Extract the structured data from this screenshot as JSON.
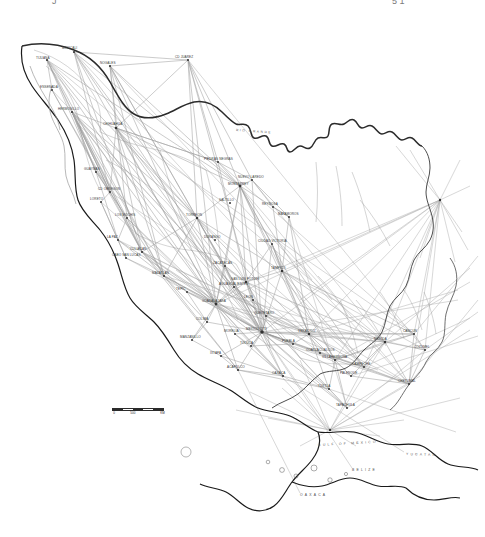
{
  "figure": {
    "kind": "map",
    "top_edge_artifacts": {
      "left_fragment": "J",
      "right_fragment": "5 1"
    }
  },
  "colors": {
    "coastline": "#1a1a1a",
    "river": "#2b2b2b",
    "internal_boundary": "#8c8c8c",
    "route_line": "#9a9a9a",
    "node": "#333333",
    "label": "#3a3a3a",
    "background": "#ffffff"
  },
  "scale_bar": {
    "label_start": "0",
    "label_mid": "500",
    "label_end": "1000",
    "units": "KM"
  },
  "hydro_labels": [
    {
      "name": "RIO GRANDE",
      "x": 236,
      "y": 128,
      "rotate": 4
    }
  ],
  "region_labels": [
    {
      "name": "GULF OF MEXICO",
      "x": 318,
      "y": 443,
      "rotate": -3
    },
    {
      "name": "YUCATAN",
      "x": 406,
      "y": 452,
      "rotate": 2
    },
    {
      "name": "BELIZE",
      "x": 352,
      "y": 468,
      "rotate": 0
    },
    {
      "name": "OAXACA",
      "x": 300,
      "y": 493,
      "rotate": 0
    }
  ],
  "places": [
    {
      "name": "TIJUANA",
      "x": 36,
      "y": 57,
      "nx": 47,
      "ny": 60
    },
    {
      "name": "MEXICALI",
      "x": 62,
      "y": 47,
      "nx": 74,
      "ny": 52
    },
    {
      "name": "NOGALES",
      "x": 100,
      "y": 62,
      "nx": 110,
      "ny": 66
    },
    {
      "name": "CD JUAREZ",
      "x": 175,
      "y": 56,
      "nx": 188,
      "ny": 60
    },
    {
      "name": "HERMOSILLO",
      "x": 58,
      "y": 108,
      "nx": 72,
      "ny": 112
    },
    {
      "name": "CHIHUAHUA",
      "x": 103,
      "y": 123,
      "nx": 116,
      "ny": 128
    },
    {
      "name": "MONTERREY",
      "x": 228,
      "y": 183,
      "nx": 240,
      "ny": 186
    },
    {
      "name": "LA PAZ",
      "x": 107,
      "y": 236,
      "nx": 118,
      "ny": 240
    },
    {
      "name": "CULIACAN",
      "x": 130,
      "y": 248,
      "nx": 142,
      "ny": 252
    },
    {
      "name": "TORREON",
      "x": 186,
      "y": 214,
      "nx": 197,
      "ny": 218
    },
    {
      "name": "DURANGO",
      "x": 204,
      "y": 236,
      "nx": 215,
      "ny": 240
    },
    {
      "name": "SALTILLO",
      "x": 219,
      "y": 199,
      "nx": 230,
      "ny": 203
    },
    {
      "name": "MAZATLAN",
      "x": 152,
      "y": 272,
      "nx": 164,
      "ny": 276
    },
    {
      "name": "TAMPICO",
      "x": 271,
      "y": 267,
      "nx": 282,
      "ny": 271
    },
    {
      "name": "SAN LUIS POTOSI",
      "x": 231,
      "y": 278,
      "nx": 246,
      "ny": 282
    },
    {
      "name": "GUADALAJARA",
      "x": 202,
      "y": 300,
      "nx": 216,
      "ny": 304
    },
    {
      "name": "LEON",
      "x": 244,
      "y": 296,
      "nx": 253,
      "ny": 300
    },
    {
      "name": "QUERETARO",
      "x": 254,
      "y": 312,
      "nx": 266,
      "ny": 316
    },
    {
      "name": "MEXICO CITY",
      "x": 246,
      "y": 328,
      "nx": 262,
      "ny": 332
    },
    {
      "name": "MANZANILLO",
      "x": 180,
      "y": 336,
      "nx": 192,
      "ny": 340
    },
    {
      "name": "PUEBLA",
      "x": 282,
      "y": 340,
      "nx": 293,
      "ny": 344
    },
    {
      "name": "VERACRUZ",
      "x": 298,
      "y": 330,
      "nx": 309,
      "ny": 334
    },
    {
      "name": "ACAPULCO",
      "x": 227,
      "y": 366,
      "nx": 238,
      "ny": 370
    },
    {
      "name": "OAXACA",
      "x": 272,
      "y": 372,
      "nx": 283,
      "ny": 376
    },
    {
      "name": "VILLAHERMOSA",
      "x": 322,
      "y": 356,
      "nx": 335,
      "ny": 360
    },
    {
      "name": "MERIDA",
      "x": 374,
      "y": 338,
      "nx": 385,
      "ny": 342
    },
    {
      "name": "CANCUN",
      "x": 403,
      "y": 330,
      "nx": 414,
      "ny": 334
    },
    {
      "name": "TUXTLA",
      "x": 318,
      "y": 385,
      "nx": 329,
      "ny": 389
    },
    {
      "name": "TAPACHULA",
      "x": 336,
      "y": 404,
      "nx": 347,
      "ny": 408
    },
    {
      "name": "CHETUMAL",
      "x": 398,
      "y": 380,
      "nx": 409,
      "ny": 384
    },
    {
      "name": "MATAMOROS",
      "x": 278,
      "y": 213,
      "nx": 289,
      "ny": 217
    },
    {
      "name": "REYNOSA",
      "x": 262,
      "y": 203,
      "nx": 273,
      "ny": 207
    },
    {
      "name": "CIUDAD VICTORIA",
      "x": 258,
      "y": 240,
      "nx": 272,
      "ny": 244
    },
    {
      "name": "ZACATECAS",
      "x": 213,
      "y": 262,
      "nx": 225,
      "ny": 266
    },
    {
      "name": "AGUASCALIENTES",
      "x": 219,
      "y": 283,
      "nx": 234,
      "ny": 287
    },
    {
      "name": "MORELIA",
      "x": 224,
      "y": 330,
      "nx": 235,
      "ny": 334
    },
    {
      "name": "TOLUCA",
      "x": 240,
      "y": 342,
      "nx": 251,
      "ny": 346
    },
    {
      "name": "COATZACOALCOS",
      "x": 306,
      "y": 349,
      "nx": 320,
      "ny": 353
    },
    {
      "name": "CAMPECHE",
      "x": 352,
      "y": 363,
      "nx": 364,
      "ny": 367
    },
    {
      "name": "LOS MOCHIS",
      "x": 115,
      "y": 214,
      "nx": 127,
      "ny": 218
    },
    {
      "name": "CD OBREGON",
      "x": 98,
      "y": 188,
      "nx": 110,
      "ny": 192
    },
    {
      "name": "GUAYMAS",
      "x": 84,
      "y": 168,
      "nx": 96,
      "ny": 172
    },
    {
      "name": "PIEDRAS NEGRAS",
      "x": 204,
      "y": 158,
      "nx": 218,
      "ny": 162
    },
    {
      "name": "NUEVO LAREDO",
      "x": 238,
      "y": 176,
      "nx": 252,
      "ny": 180
    },
    {
      "name": "ENSENADA",
      "x": 40,
      "y": 86,
      "nx": 52,
      "ny": 90
    },
    {
      "name": "LORETO",
      "x": 90,
      "y": 198,
      "nx": 101,
      "ny": 202
    },
    {
      "name": "CABO SAN LUCAS",
      "x": 112,
      "y": 254,
      "nx": 126,
      "ny": 258
    },
    {
      "name": "TEPIC",
      "x": 176,
      "y": 288,
      "nx": 187,
      "ny": 292
    },
    {
      "name": "COLIMA",
      "x": 196,
      "y": 318,
      "nx": 207,
      "ny": 322
    },
    {
      "name": "IXTAPA",
      "x": 210,
      "y": 352,
      "nx": 221,
      "ny": 356
    },
    {
      "name": "PALENQUE",
      "x": 340,
      "y": 372,
      "nx": 351,
      "ny": 376
    },
    {
      "name": "COZUMEL",
      "x": 414,
      "y": 346,
      "nx": 425,
      "ny": 350
    }
  ]
}
